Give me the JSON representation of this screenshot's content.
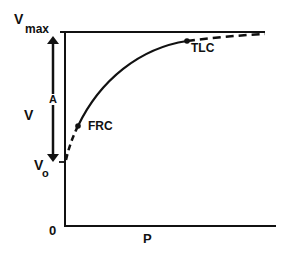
{
  "diagram": {
    "type": "pressure-volume curve",
    "axes": {
      "x_label": "P",
      "y_label": "V",
      "origin_label": "0"
    },
    "levels": {
      "vmax": {
        "main": "V",
        "sub": "max"
      },
      "v0": {
        "main": "V",
        "sub": "o"
      }
    },
    "arrow_label": "A",
    "points": [
      {
        "label": "FRC"
      },
      {
        "label": "TLC"
      }
    ],
    "colors": {
      "ink": "#111111",
      "background": "#ffffff"
    }
  }
}
